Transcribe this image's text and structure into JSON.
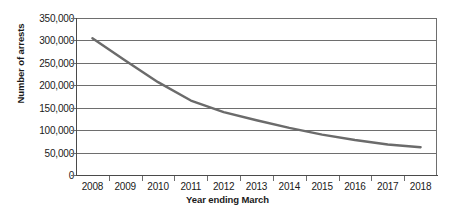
{
  "chart_data": {
    "type": "line",
    "title": "",
    "xlabel": "Year ending March",
    "ylabel": "Number of arrests",
    "categories": [
      "2008",
      "2009",
      "2010",
      "2011",
      "2012",
      "2013",
      "2014",
      "2015",
      "2016",
      "2017",
      "2018"
    ],
    "series": [
      {
        "name": "Number of arrests",
        "values": [
          305000,
          255000,
          207000,
          166000,
          140000,
          122000,
          105000,
          90000,
          78000,
          68000,
          62000
        ]
      }
    ],
    "ylim": [
      0,
      350000
    ],
    "yticks": [
      0,
      50000,
      100000,
      150000,
      200000,
      250000,
      300000,
      350000
    ],
    "ytick_labels": [
      "0",
      "50,000",
      "100,000",
      "150,000",
      "200,000",
      "250,000",
      "300,000",
      "350,000"
    ],
    "grid": "horizontal",
    "legend": "none",
    "line_color": "#6b6b6b"
  },
  "axis": {
    "y_title": "Number of arrests",
    "x_title": "Year ending March"
  },
  "colors": {
    "line": "#6b6b6b",
    "grid": "#6e6e6e",
    "axis": "#4a4a4a",
    "text": "#1a1a1a",
    "background": "#ffffff"
  }
}
